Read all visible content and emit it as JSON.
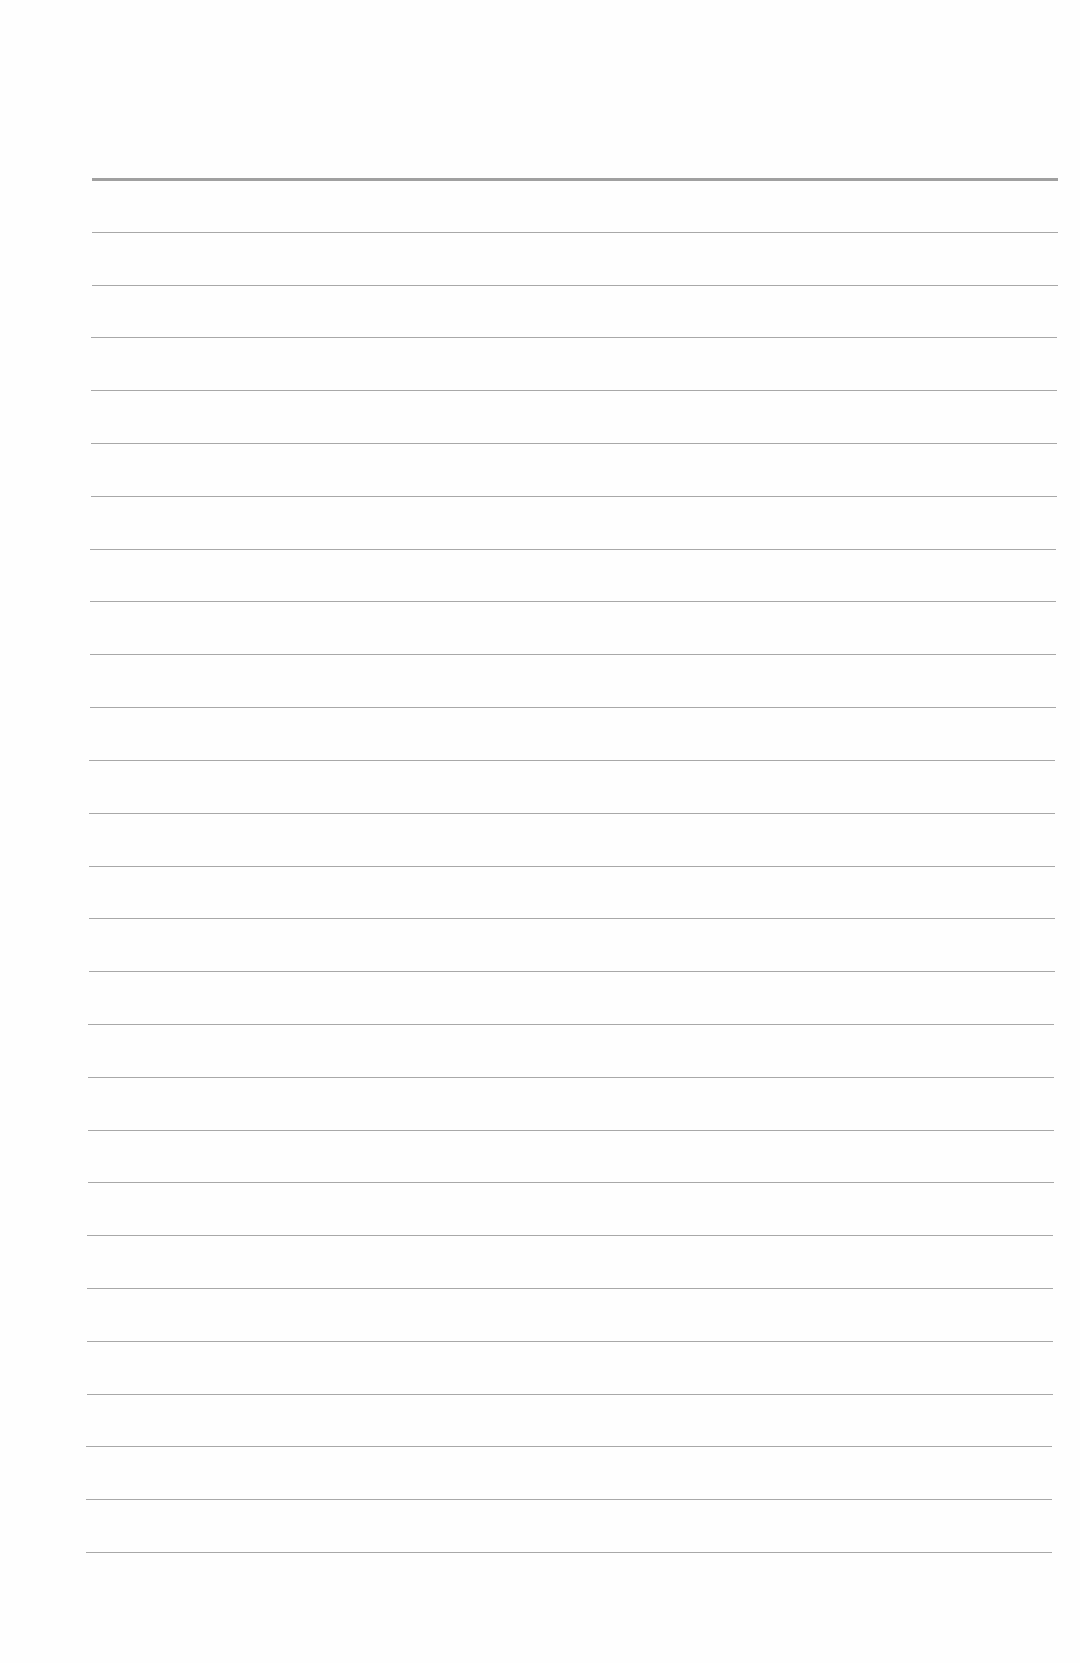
{
  "page": {
    "type": "lined-paper",
    "background_color": "#fefefe",
    "rule_color": "#a8a8a8",
    "line_count": 27,
    "first_line_y": 179,
    "last_line_y": 1552,
    "line_spacing": 52.8
  }
}
